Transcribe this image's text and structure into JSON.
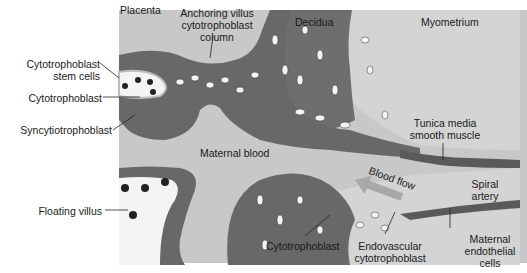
{
  "diagram": {
    "colors": {
      "background": "#ffffff",
      "maternal_blood": "#c8c8c8",
      "myometrium": "#d2d2d2",
      "decidua": "#6e6e6e",
      "villus_tissue": "#6a6a6a",
      "cell_fill": "#f4f4f4",
      "nucleus": "#222222",
      "blood_flow_arrow": "#a8a8a8"
    },
    "labels": {
      "placenta": "Placenta",
      "anchoring_villus_line1": "Anchoring villus",
      "anchoring_villus_line2": "cytotrophoblast",
      "anchoring_villus_line3": "column",
      "decidua": "Decidua",
      "myometrium": "Myometrium",
      "cyto_stem_line1": "Cytotrophoblast",
      "cyto_stem_line2": "stem cells",
      "cytotrophoblast_left": "Cytotrophoblast",
      "syncytiotrophoblast": "Syncytiotrophoblast",
      "maternal_blood": "Maternal blood",
      "tunica_line1": "Tunica media",
      "tunica_line2": "smooth muscle",
      "blood_flow": "Blood flow",
      "spiral_line1": "Spiral",
      "spiral_line2": "artery",
      "floating_villus": "Floating villus",
      "cytotrophoblast_bottom": "Cytotrophoblast",
      "endovascular_line1": "Endovascular",
      "endovascular_line2": "cytotrophoblast",
      "maternal_endo_line1": "Maternal",
      "maternal_endo_line2": "endothelial",
      "maternal_endo_line3": "cells"
    }
  }
}
